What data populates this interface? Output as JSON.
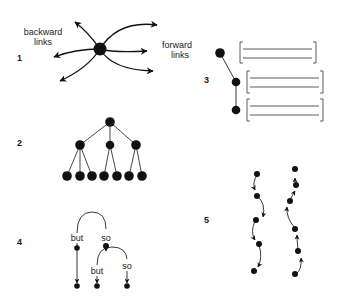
{
  "panels": [
    {
      "number": "1",
      "description": "node with backward and forward links",
      "labels": {
        "backward_line1": "backward",
        "backward_line2": "links",
        "forward_line1": "forward",
        "forward_line2": "links"
      }
    },
    {
      "number": "2",
      "description": "hierarchical tree: 1 root, 3 children, 7 leaves"
    },
    {
      "number": "3",
      "description": "three nodes linked to bracketed text blocks"
    },
    {
      "number": "4",
      "description": "branching links labeled with connectives",
      "labels": {
        "but_top": "but",
        "so_top": "so",
        "but_bottom": "but",
        "so_bottom": "so"
      }
    },
    {
      "number": "5",
      "description": "two chains of linked nodes, one downward, one upward"
    }
  ],
  "colors": {
    "ink": "#111111",
    "background": "#ffffff"
  }
}
